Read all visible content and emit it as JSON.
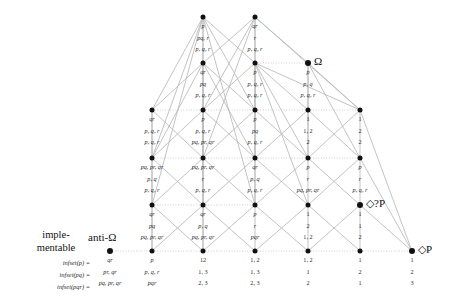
{
  "figure": {
    "type": "hasse-lattice-diagram",
    "width": 456,
    "height": 304,
    "edge_color": "#b8b8b8",
    "node_color": "#111111",
    "text_color": "#2b2b2b"
  },
  "markers": {
    "omega": "Ω",
    "diamond_query_p": "◇?P",
    "diamond_p": "◇P",
    "implementable_line1": "imple-",
    "implementable_line2": "mentable",
    "anti_omega": "anti-Ω"
  },
  "row_labels": [
    "infset(p) =",
    "infset(pq) =",
    "infset(pqr) ="
  ],
  "columns_x": [
    152,
    203,
    255,
    308,
    360,
    412
  ],
  "rows_y": [
    17,
    63,
    110,
    158,
    205,
    251
  ],
  "nodes": [
    {
      "id": "r0c1",
      "col": 1,
      "row": 0,
      "x": 203,
      "y": 17,
      "marker": "",
      "cells": [
        "p",
        "pq, r",
        "p, q, r"
      ]
    },
    {
      "id": "r0c2",
      "col": 2,
      "row": 0,
      "x": 255,
      "y": 17,
      "marker": "",
      "cells": [
        "qr",
        "r",
        "p, q, r"
      ]
    },
    {
      "id": "r1c1",
      "col": 1,
      "row": 1,
      "x": 203,
      "y": 63,
      "marker": "",
      "cells": [
        "qr",
        "pq",
        "p, q, r"
      ]
    },
    {
      "id": "r1c2",
      "col": 2,
      "row": 1,
      "x": 255,
      "y": 63,
      "marker": "",
      "cells": [
        "p",
        "p, q, r",
        "p, q, r"
      ]
    },
    {
      "id": "r1c3",
      "col": 3,
      "row": 1,
      "x": 308,
      "y": 63,
      "marker": "Ω",
      "cells": [
        "p",
        "p, q",
        "p, q, r"
      ]
    },
    {
      "id": "r2c0",
      "col": 0,
      "row": 2,
      "x": 152,
      "y": 110,
      "marker": "",
      "cells": [
        "qr",
        "p, q, r",
        "p, q, r"
      ]
    },
    {
      "id": "r2c1",
      "col": 1,
      "row": 2,
      "x": 203,
      "y": 110,
      "marker": "",
      "cells": [
        "p",
        "p, q, r",
        "pq, pr, qr"
      ]
    },
    {
      "id": "r2c2",
      "col": 2,
      "row": 2,
      "x": 255,
      "y": 110,
      "marker": "",
      "cells": [
        "p",
        "pq",
        "p, q, r"
      ]
    },
    {
      "id": "r2c3",
      "col": 3,
      "row": 2,
      "x": 308,
      "y": 110,
      "marker": "",
      "cells": [
        "1",
        "1, 2",
        "2"
      ]
    },
    {
      "id": "r2c4",
      "col": 4,
      "row": 2,
      "x": 360,
      "y": 110,
      "marker": "",
      "cells": [
        "1",
        "2",
        "2"
      ]
    },
    {
      "id": "r3c0",
      "col": 0,
      "row": 3,
      "x": 152,
      "y": 158,
      "marker": "",
      "cells": [
        "pq, pr, qr",
        "p, q",
        "p, q, r"
      ]
    },
    {
      "id": "r3c1",
      "col": 1,
      "row": 3,
      "x": 203,
      "y": 158,
      "marker": "",
      "cells": [
        "pq, pr, qr",
        "r",
        "p, q, r"
      ]
    },
    {
      "id": "r3c2",
      "col": 2,
      "row": 3,
      "x": 255,
      "y": 158,
      "marker": "",
      "cells": [
        "qr",
        "p, q",
        "p, q, r"
      ]
    },
    {
      "id": "r3c3",
      "col": 3,
      "row": 3,
      "x": 308,
      "y": 158,
      "marker": "",
      "cells": [
        "p",
        "r",
        "pq, pr, qr"
      ]
    },
    {
      "id": "r3c4",
      "col": 4,
      "row": 3,
      "x": 360,
      "y": 158,
      "marker": "",
      "cells": [
        "p",
        "r",
        "p, q, r"
      ]
    },
    {
      "id": "r4c0",
      "col": 0,
      "row": 4,
      "x": 152,
      "y": 205,
      "marker": "",
      "cells": [
        "qr",
        "pq",
        "pq, pr, qr"
      ]
    },
    {
      "id": "r4c1",
      "col": 1,
      "row": 4,
      "x": 203,
      "y": 205,
      "marker": "",
      "cells": [
        "qr",
        "p, q",
        "pq, pr, qr"
      ]
    },
    {
      "id": "r4c2",
      "col": 2,
      "row": 4,
      "x": 255,
      "y": 205,
      "marker": "",
      "cells": [
        "p",
        "r",
        "pqr"
      ]
    },
    {
      "id": "r4c3",
      "col": 3,
      "row": 4,
      "x": 308,
      "y": 205,
      "marker": "",
      "cells": [
        "1",
        "2",
        "1, 2"
      ]
    },
    {
      "id": "r4c4",
      "col": 4,
      "row": 4,
      "x": 360,
      "y": 205,
      "marker": "◇?P",
      "cells": [
        "1",
        "1",
        "2"
      ]
    },
    {
      "id": "r5c-1",
      "col": -1,
      "row": 5,
      "x": 110,
      "y": 251,
      "marker": "anti-Ω",
      "cells": [
        "qr",
        "pr, qr",
        "pq, pr, qr"
      ]
    },
    {
      "id": "r5c0",
      "col": 0,
      "row": 5,
      "x": 152,
      "y": 251,
      "marker": "",
      "cells": [
        "p",
        "p, q, r",
        "pqr"
      ]
    },
    {
      "id": "r5c1",
      "col": 1,
      "row": 5,
      "x": 203,
      "y": 251,
      "marker": "",
      "cells": [
        "12",
        "1, 3",
        "2, 3"
      ]
    },
    {
      "id": "r5c2",
      "col": 2,
      "row": 5,
      "x": 255,
      "y": 251,
      "marker": "",
      "cells": [
        "1, 2",
        "1, 3",
        "2, 3"
      ]
    },
    {
      "id": "r5c3",
      "col": 3,
      "row": 5,
      "x": 308,
      "y": 251,
      "marker": "",
      "cells": [
        "1, 2",
        "1",
        "2"
      ]
    },
    {
      "id": "r5c4",
      "col": 4,
      "row": 5,
      "x": 360,
      "y": 251,
      "marker": "",
      "cells": [
        "1",
        "2",
        "1"
      ]
    },
    {
      "id": "r5c5",
      "col": 5,
      "row": 5,
      "x": 412,
      "y": 251,
      "marker": "◇P",
      "cells": [
        "1",
        "2",
        "3"
      ]
    }
  ],
  "edges": [
    {
      "from": "r0c1",
      "to": "r1c1",
      "style": "solid"
    },
    {
      "from": "r0c1",
      "to": "r1c2",
      "style": "solid"
    },
    {
      "from": "r0c1",
      "to": "r2c0",
      "style": "solid"
    },
    {
      "from": "r0c1",
      "to": "r2c2",
      "style": "solid"
    },
    {
      "from": "r0c1",
      "to": "r3c0",
      "style": "solid"
    },
    {
      "from": "r0c1",
      "to": "r3c1",
      "style": "solid"
    },
    {
      "from": "r0c1",
      "to": "r4c0",
      "style": "solid"
    },
    {
      "from": "r0c2",
      "to": "r1c2",
      "style": "solid"
    },
    {
      "from": "r0c2",
      "to": "r1c1",
      "style": "solid"
    },
    {
      "from": "r0c2",
      "to": "r1c3",
      "style": "solid"
    },
    {
      "from": "r0c2",
      "to": "r2c1",
      "style": "solid"
    },
    {
      "from": "r0c2",
      "to": "r2c4",
      "style": "solid"
    },
    {
      "from": "r0c2",
      "to": "r3c1",
      "style": "solid"
    },
    {
      "from": "r1c1",
      "to": "r2c0",
      "style": "solid"
    },
    {
      "from": "r1c1",
      "to": "r2c1",
      "style": "solid"
    },
    {
      "from": "r1c1",
      "to": "r2c2",
      "style": "solid"
    },
    {
      "from": "r1c1",
      "to": "r3c0",
      "style": "solid"
    },
    {
      "from": "r1c1",
      "to": "r3c2",
      "style": "solid"
    },
    {
      "from": "r1c2",
      "to": "r2c1",
      "style": "solid"
    },
    {
      "from": "r1c2",
      "to": "r2c2",
      "style": "solid"
    },
    {
      "from": "r1c2",
      "to": "r2c3",
      "style": "solid"
    },
    {
      "from": "r1c2",
      "to": "r2c4",
      "style": "solid"
    },
    {
      "from": "r1c2",
      "to": "r3c2",
      "style": "solid"
    },
    {
      "from": "r1c2",
      "to": "r3c3",
      "style": "solid"
    },
    {
      "from": "r1c2",
      "to": "r1c3",
      "style": "dotted"
    },
    {
      "from": "r1c3",
      "to": "r2c3",
      "style": "solid"
    },
    {
      "from": "r1c3",
      "to": "r2c4",
      "style": "solid"
    },
    {
      "from": "r1c3",
      "to": "r3c3",
      "style": "solid"
    },
    {
      "from": "r1c3",
      "to": "r3c4",
      "style": "solid"
    },
    {
      "from": "r2c0",
      "to": "r3c0",
      "style": "solid"
    },
    {
      "from": "r2c0",
      "to": "r3c1",
      "style": "solid"
    },
    {
      "from": "r2c0",
      "to": "r2c1",
      "style": "dotted"
    },
    {
      "from": "r2c1",
      "to": "r3c0",
      "style": "solid"
    },
    {
      "from": "r2c1",
      "to": "r3c1",
      "style": "solid"
    },
    {
      "from": "r2c1",
      "to": "r3c2",
      "style": "solid"
    },
    {
      "from": "r2c1",
      "to": "r2c2",
      "style": "dotted"
    },
    {
      "from": "r2c2",
      "to": "r3c1",
      "style": "solid"
    },
    {
      "from": "r2c2",
      "to": "r3c2",
      "style": "solid"
    },
    {
      "from": "r2c2",
      "to": "r3c3",
      "style": "solid"
    },
    {
      "from": "r2c2",
      "to": "r2c3",
      "style": "dotted"
    },
    {
      "from": "r2c3",
      "to": "r3c2",
      "style": "solid"
    },
    {
      "from": "r2c3",
      "to": "r3c3",
      "style": "solid"
    },
    {
      "from": "r2c3",
      "to": "r3c4",
      "style": "solid"
    },
    {
      "from": "r2c3",
      "to": "r2c4",
      "style": "dotted"
    },
    {
      "from": "r2c4",
      "to": "r3c3",
      "style": "solid"
    },
    {
      "from": "r2c4",
      "to": "r3c4",
      "style": "solid"
    },
    {
      "from": "r2c4",
      "to": "r5c5",
      "style": "solid"
    },
    {
      "from": "r3c0",
      "to": "r4c0",
      "style": "solid"
    },
    {
      "from": "r3c0",
      "to": "r4c1",
      "style": "solid"
    },
    {
      "from": "r3c0",
      "to": "r3c1",
      "style": "dotted"
    },
    {
      "from": "r3c1",
      "to": "r4c0",
      "style": "solid"
    },
    {
      "from": "r3c1",
      "to": "r4c1",
      "style": "solid"
    },
    {
      "from": "r3c1",
      "to": "r4c2",
      "style": "solid"
    },
    {
      "from": "r3c1",
      "to": "r3c2",
      "style": "dotted"
    },
    {
      "from": "r3c2",
      "to": "r4c1",
      "style": "solid"
    },
    {
      "from": "r3c2",
      "to": "r4c2",
      "style": "solid"
    },
    {
      "from": "r3c2",
      "to": "r4c3",
      "style": "solid"
    },
    {
      "from": "r3c2",
      "to": "r3c3",
      "style": "dotted"
    },
    {
      "from": "r3c3",
      "to": "r4c2",
      "style": "solid"
    },
    {
      "from": "r3c3",
      "to": "r4c3",
      "style": "solid"
    },
    {
      "from": "r3c3",
      "to": "r4c4",
      "style": "solid"
    },
    {
      "from": "r3c3",
      "to": "r3c4",
      "style": "dotted"
    },
    {
      "from": "r3c4",
      "to": "r4c3",
      "style": "solid"
    },
    {
      "from": "r3c4",
      "to": "r4c4",
      "style": "solid"
    },
    {
      "from": "r3c4",
      "to": "r5c5",
      "style": "solid"
    },
    {
      "from": "r4c0",
      "to": "r5c0",
      "style": "solid"
    },
    {
      "from": "r4c0",
      "to": "r5c1",
      "style": "solid"
    },
    {
      "from": "r4c0",
      "to": "r4c1",
      "style": "dotted"
    },
    {
      "from": "r4c1",
      "to": "r5c0",
      "style": "solid"
    },
    {
      "from": "r4c1",
      "to": "r5c1",
      "style": "solid"
    },
    {
      "from": "r4c1",
      "to": "r5c2",
      "style": "solid"
    },
    {
      "from": "r4c1",
      "to": "r4c2",
      "style": "dotted"
    },
    {
      "from": "r4c2",
      "to": "r5c1",
      "style": "solid"
    },
    {
      "from": "r4c2",
      "to": "r5c2",
      "style": "solid"
    },
    {
      "from": "r4c2",
      "to": "r5c3",
      "style": "solid"
    },
    {
      "from": "r4c3",
      "to": "r5c2",
      "style": "solid"
    },
    {
      "from": "r4c3",
      "to": "r5c3",
      "style": "solid"
    },
    {
      "from": "r4c3",
      "to": "r5c4",
      "style": "solid"
    },
    {
      "from": "r4c4",
      "to": "r5c3",
      "style": "solid"
    },
    {
      "from": "r4c4",
      "to": "r5c4",
      "style": "solid"
    },
    {
      "from": "r4c4",
      "to": "r5c5",
      "style": "solid"
    },
    {
      "from": "r5c-1",
      "to": "r5c0",
      "style": "dotted"
    },
    {
      "from": "r5c0",
      "to": "r5c1",
      "style": "dotted"
    },
    {
      "from": "r5c1",
      "to": "r5c2",
      "style": "dotted"
    },
    {
      "from": "r5c2",
      "to": "r5c3",
      "style": "dotted"
    },
    {
      "from": "r5c3",
      "to": "r5c4",
      "style": "dotted"
    },
    {
      "from": "r5c4",
      "to": "r5c5",
      "style": "dotted"
    },
    {
      "from": "r0c1",
      "to": "r4c2",
      "style": "solid"
    },
    {
      "from": "r0c2",
      "to": "r4c2",
      "style": "solid"
    },
    {
      "from": "r1c1",
      "to": "r4c1",
      "style": "solid"
    },
    {
      "from": "r1c2",
      "to": "r4c3",
      "style": "solid"
    },
    {
      "from": "r2c0",
      "to": "r5c0",
      "style": "solid"
    },
    {
      "from": "r2c1",
      "to": "r5c1",
      "style": "solid"
    }
  ]
}
